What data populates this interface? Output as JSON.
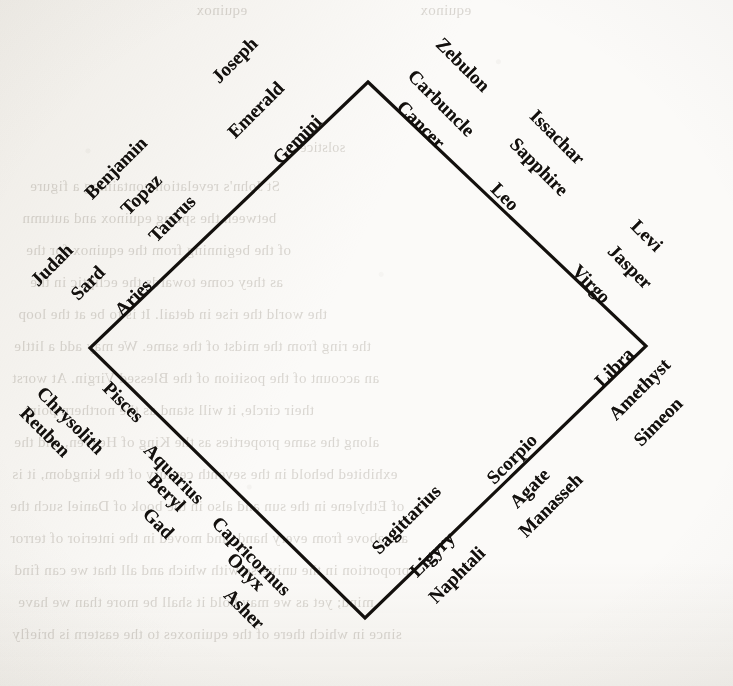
{
  "figure": {
    "kind": "rotated-square-diagram",
    "ink_color": "#13100d",
    "paper_color": "#fbfaf8",
    "bleed_color": "#b9b4ac"
  },
  "diamond": {
    "top_vertex": {
      "x": 368,
      "y": 82
    },
    "left_vertex": {
      "x": 90,
      "y": 348
    },
    "bottom_vertex": {
      "x": 365,
      "y": 618
    },
    "right_vertex": {
      "x": 646,
      "y": 346
    },
    "stroke_width": 3.2
  },
  "rings": {
    "inner_label": "zodiac sign",
    "middle_label": "gemstone",
    "outer_label": "tribe of Israel"
  },
  "sides": [
    {
      "name": "upper-left",
      "order": "Aries at the west vertex rising to Gemini at the north vertex",
      "entries": [
        {
          "sign": "Aries",
          "stone": "Sard",
          "tribe": "Judah"
        },
        {
          "sign": "Taurus",
          "stone": "Topaz",
          "tribe": "Benjamin"
        },
        {
          "sign": "Gemini",
          "stone": "Emerald",
          "tribe": "Joseph"
        }
      ]
    },
    {
      "name": "upper-right",
      "order": "Cancer at the north vertex descending to Virgo at the east vertex",
      "entries": [
        {
          "sign": "Cancer",
          "stone": "Carbuncle",
          "tribe": "Zebulon"
        },
        {
          "sign": "Leo",
          "stone": "Sapphire",
          "tribe": "Issachar"
        },
        {
          "sign": "Virgo",
          "stone": "Jasper",
          "tribe": "Levi"
        }
      ]
    },
    {
      "name": "lower-right",
      "order": "Libra at the east vertex descending to Sagittarius at the south vertex",
      "entries": [
        {
          "sign": "Libra",
          "stone": "Amethyst",
          "tribe": "Simeon"
        },
        {
          "sign": "Scorpio",
          "stone": "Agate",
          "tribe": "Manasseh"
        },
        {
          "sign": "Sagittarius",
          "stone": "Ligyry",
          "tribe": "Naphtali"
        }
      ]
    },
    {
      "name": "lower-left",
      "order": "Capricornus at the south vertex rising to Pisces at the west vertex",
      "entries": [
        {
          "sign": "Capricornus",
          "stone": "Onyx",
          "tribe": "Asher"
        },
        {
          "sign": "Aquarius",
          "stone": "Beryl",
          "tribe": "Gad"
        },
        {
          "sign": "Pisces",
          "stone": "Chrysolith",
          "tribe": "Reuben"
        }
      ]
    }
  ],
  "labels": [
    {
      "text": "Aries",
      "x": 118,
      "y": 302,
      "rot": -45,
      "ring": "inner"
    },
    {
      "text": "Taurus",
      "x": 152,
      "y": 228,
      "rot": -45,
      "ring": "inner"
    },
    {
      "text": "Gemini",
      "x": 276,
      "y": 150,
      "rot": -45,
      "ring": "inner"
    },
    {
      "text": "Sard",
      "x": 74,
      "y": 286,
      "rot": -45,
      "ring": "middle"
    },
    {
      "text": "Topaz",
      "x": 124,
      "y": 201,
      "rot": -45,
      "ring": "middle"
    },
    {
      "text": "Emerald",
      "x": 231,
      "y": 124,
      "rot": -45,
      "ring": "middle"
    },
    {
      "text": "Judah",
      "x": 34,
      "y": 272,
      "rot": -45,
      "ring": "outer"
    },
    {
      "text": "Benjamin",
      "x": 88,
      "y": 185,
      "rot": -45,
      "ring": "outer"
    },
    {
      "text": "Joseph",
      "x": 215,
      "y": 69,
      "rot": -45,
      "ring": "outer"
    },
    {
      "text": "Cancer",
      "x": 400,
      "y": 93,
      "rot": 45,
      "ring": "inner"
    },
    {
      "text": "Leo",
      "x": 494,
      "y": 175,
      "rot": 45,
      "ring": "inner"
    },
    {
      "text": "Virgo",
      "x": 575,
      "y": 257,
      "rot": 45,
      "ring": "inner"
    },
    {
      "text": "Carbuncle",
      "x": 411,
      "y": 62,
      "rot": 45,
      "ring": "middle"
    },
    {
      "text": "Sapphire",
      "x": 513,
      "y": 130,
      "rot": 45,
      "ring": "middle"
    },
    {
      "text": "Jasper",
      "x": 611,
      "y": 237,
      "rot": 45,
      "ring": "middle"
    },
    {
      "text": "Zebulon",
      "x": 439,
      "y": 30,
      "rot": 45,
      "ring": "outer"
    },
    {
      "text": "Issachar",
      "x": 533,
      "y": 102,
      "rot": 45,
      "ring": "outer"
    },
    {
      "text": "Levi",
      "x": 634,
      "y": 212,
      "rot": 45,
      "ring": "outer"
    },
    {
      "text": "Libra",
      "x": 598,
      "y": 373,
      "rot": -45,
      "ring": "inner"
    },
    {
      "text": "Scorpio",
      "x": 490,
      "y": 470,
      "rot": -45,
      "ring": "inner"
    },
    {
      "text": "Sagittarius",
      "x": 375,
      "y": 540,
      "rot": -45,
      "ring": "inner"
    },
    {
      "text": "Amethyst",
      "x": 612,
      "y": 406,
      "rot": -45,
      "ring": "middle"
    },
    {
      "text": "Agate",
      "x": 513,
      "y": 494,
      "rot": -45,
      "ring": "middle"
    },
    {
      "text": "Ligyry",
      "x": 413,
      "y": 563,
      "rot": -45,
      "ring": "middle"
    },
    {
      "text": "Simeon",
      "x": 637,
      "y": 432,
      "rot": -45,
      "ring": "outer"
    },
    {
      "text": "Manasseh",
      "x": 522,
      "y": 523,
      "rot": -45,
      "ring": "outer"
    },
    {
      "text": "Naphtali",
      "x": 432,
      "y": 589,
      "rot": -45,
      "ring": "outer"
    },
    {
      "text": "Capricornus",
      "x": 215,
      "y": 509,
      "rot": 45,
      "ring": "inner"
    },
    {
      "text": "Aquarius",
      "x": 147,
      "y": 436,
      "rot": 45,
      "ring": "inner"
    },
    {
      "text": "Pisces",
      "x": 106,
      "y": 374,
      "rot": 45,
      "ring": "inner"
    },
    {
      "text": "Onyx",
      "x": 230,
      "y": 545,
      "rot": 45,
      "ring": "middle"
    },
    {
      "text": "Beryl",
      "x": 151,
      "y": 466,
      "rot": 45,
      "ring": "middle"
    },
    {
      "text": "Chrysolith",
      "x": 40,
      "y": 379,
      "rot": 45,
      "ring": "middle"
    },
    {
      "text": "Asher",
      "x": 227,
      "y": 581,
      "rot": 45,
      "ring": "outer"
    },
    {
      "text": "Gad",
      "x": 146,
      "y": 500,
      "rot": 45,
      "ring": "outer"
    },
    {
      "text": "Reuben",
      "x": 23,
      "y": 399,
      "rot": 45,
      "ring": "outer"
    }
  ],
  "bleed_through": [
    {
      "text": "equinox",
      "x": 196,
      "y": 2,
      "size": 15,
      "mirrored": true
    },
    {
      "text": "equinox",
      "x": 420,
      "y": 2,
      "size": 15,
      "mirrored": true
    },
    {
      "text": "solstice",
      "x": 300,
      "y": 140,
      "size": 14,
      "mirrored": true
    },
    {
      "text": "St John's revelation containing a figure",
      "x": 30,
      "y": 178,
      "size": 15,
      "mirrored": true
    },
    {
      "text": "between the spring equinox and autumn",
      "x": 22,
      "y": 210,
      "size": 15,
      "mirrored": true
    },
    {
      "text": "of the beginning from the equinox for the",
      "x": 26,
      "y": 242,
      "size": 15,
      "mirrored": true
    },
    {
      "text": "as they come towards the ecliptic in the",
      "x": 30,
      "y": 274,
      "size": 15,
      "mirrored": true
    },
    {
      "text": "the world the rise in detail. It is to be at the loop",
      "x": 18,
      "y": 306,
      "size": 15,
      "mirrored": true
    },
    {
      "text": "the ring from the midst of the same. We may add a little",
      "x": 14,
      "y": 338,
      "size": 15,
      "mirrored": true
    },
    {
      "text": "an account of the position of the Blessed Virgin. At worst",
      "x": 12,
      "y": 370,
      "size": 15,
      "mirrored": true
    },
    {
      "text": "their circle, it will stand as the northern point",
      "x": 24,
      "y": 402,
      "size": 15,
      "mirrored": true
    },
    {
      "text": "along the same properties as the King of Heaven, and the",
      "x": 14,
      "y": 434,
      "size": 15,
      "mirrored": true
    },
    {
      "text": "exhibited behold in the seventh century of the kingdom, it is",
      "x": 12,
      "y": 466,
      "size": 15,
      "mirrored": true
    },
    {
      "text": "of Ethylene in the sun and also in the book of Daniel such the",
      "x": 10,
      "y": 498,
      "size": 15,
      "mirrored": true
    },
    {
      "text": "are above from every hand, and moved in the interior of terror",
      "x": 10,
      "y": 530,
      "size": 15,
      "mirrored": true
    },
    {
      "text": "proportion in the universe with which and all that we can find",
      "x": 14,
      "y": 562,
      "size": 15,
      "mirrored": true
    },
    {
      "text": "mind; yet as we may hold it shall be more than we have",
      "x": 18,
      "y": 594,
      "size": 15,
      "mirrored": true
    },
    {
      "text": "since in which there of the equinoxes to the eastern is briefly",
      "x": 12,
      "y": 626,
      "size": 15,
      "mirrored": true
    }
  ]
}
